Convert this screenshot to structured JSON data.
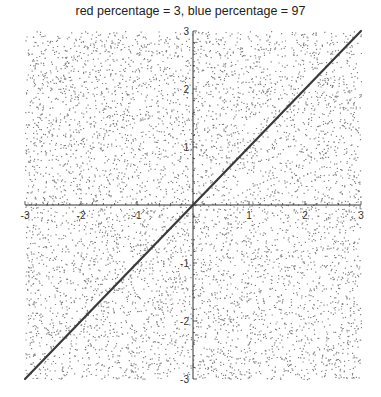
{
  "chart_data": {
    "type": "scatter",
    "title": "red percentage = 3, blue percentage = 97",
    "xlabel": "",
    "ylabel": "",
    "xlim": [
      -3,
      3
    ],
    "ylim": [
      -3,
      3
    ],
    "x_ticks": [
      -3,
      -2,
      -1,
      1,
      2,
      3
    ],
    "y_ticks": [
      3,
      2,
      1,
      -1,
      -2,
      -3
    ],
    "x_tick_labels": [
      "-3",
      "-2",
      "-1",
      "1",
      "2",
      "3"
    ],
    "y_tick_labels": [
      "3",
      "2",
      "1",
      "-1",
      "-2",
      "-3"
    ],
    "grid": false,
    "legend": null,
    "series": [
      {
        "name": "uniform random points",
        "kind": "scatter",
        "distribution": "uniform over [-3,3]x[-3,3]",
        "approx_count": 6000,
        "color": "#555555"
      },
      {
        "name": "line y = x",
        "kind": "line",
        "x": [
          -3,
          3
        ],
        "y": [
          -3,
          3
        ],
        "color": "#444444"
      }
    ],
    "annotations": {
      "red_percentage": 3,
      "blue_percentage": 97
    }
  },
  "plot": {
    "left": 25,
    "right": 361,
    "top": 31,
    "bottom": 379,
    "origin_x": 193,
    "origin_y": 205,
    "dot_color": "#5a5a5a",
    "axis_color": "#333333",
    "line_color": "#3a3a3a"
  }
}
